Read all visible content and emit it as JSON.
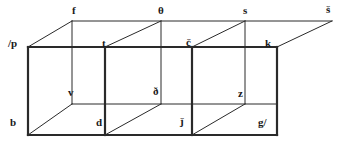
{
  "figure": {
    "background_color": "#ffffff",
    "stroke_color": "#2a2a2a",
    "thick_stroke_width": 2.2,
    "thin_stroke_width": 1.0,
    "width": 343,
    "height": 145
  },
  "vertices": [
    {
      "id": "p",
      "label": "/p",
      "x": 8,
      "y": 38,
      "role": "back-top-left"
    },
    {
      "id": "f",
      "label": "f",
      "x": 72,
      "y": 5,
      "role": "back-top-1"
    },
    {
      "id": "theta",
      "label": "θ",
      "x": 158,
      "y": 5,
      "role": "back-top-2"
    },
    {
      "id": "s",
      "label": "s",
      "x": 243,
      "y": 5,
      "role": "back-top-3"
    },
    {
      "id": "shacek",
      "label": "š",
      "x": 326,
      "y": 4,
      "role": "back-top-4"
    },
    {
      "id": "t",
      "label": "t",
      "x": 102,
      "y": 38,
      "role": "front-top-1"
    },
    {
      "id": "ccaron",
      "label": "č",
      "x": 186,
      "y": 37,
      "role": "front-top-2"
    },
    {
      "id": "k",
      "label": "k",
      "x": 265,
      "y": 38,
      "role": "front-top-3"
    },
    {
      "id": "v",
      "label": "v",
      "x": 68,
      "y": 87,
      "role": "back-bottom-1"
    },
    {
      "id": "eth",
      "label": "ð",
      "x": 153,
      "y": 86,
      "role": "back-bottom-2"
    },
    {
      "id": "z",
      "label": "z",
      "x": 238,
      "y": 88,
      "role": "back-bottom-3"
    },
    {
      "id": "b",
      "label": "b",
      "x": 10,
      "y": 117,
      "role": "front-bottom-left"
    },
    {
      "id": "d",
      "label": "d",
      "x": 96,
      "y": 117,
      "role": "front-bottom-1"
    },
    {
      "id": "jcaron",
      "label": "ǰ",
      "x": 180,
      "y": 116,
      "role": "front-bottom-2"
    },
    {
      "id": "g",
      "label": "g/",
      "x": 258,
      "y": 117,
      "role": "front-bottom-3"
    }
  ],
  "edges": {
    "thick": [
      {
        "name": "front-face-top-rail",
        "x1": 28,
        "y1": 47,
        "x2": 277,
        "y2": 47
      },
      {
        "name": "front-face-bottom-rail",
        "x1": 28,
        "y1": 135,
        "x2": 277,
        "y2": 135
      },
      {
        "name": "front-left-vertical",
        "x1": 28,
        "y1": 47,
        "x2": 28,
        "y2": 135
      },
      {
        "name": "front-divider-1",
        "x1": 105,
        "y1": 47,
        "x2": 105,
        "y2": 135
      },
      {
        "name": "front-divider-2",
        "x1": 192,
        "y1": 47,
        "x2": 192,
        "y2": 135
      },
      {
        "name": "front-right-vertical",
        "x1": 277,
        "y1": 47,
        "x2": 277,
        "y2": 135
      }
    ],
    "thin": [
      {
        "name": "back-top-rail",
        "x1": 72,
        "y1": 21,
        "x2": 332,
        "y2": 21
      },
      {
        "name": "back-mid-rail",
        "x1": 72,
        "y1": 104,
        "x2": 277,
        "y2": 104
      },
      {
        "name": "back-vertical-f",
        "x1": 72,
        "y1": 21,
        "x2": 72,
        "y2": 104
      },
      {
        "name": "back-vertical-theta",
        "x1": 161,
        "y1": 21,
        "x2": 161,
        "y2": 104
      },
      {
        "name": "back-vertical-s",
        "x1": 245,
        "y1": 21,
        "x2": 245,
        "y2": 104
      },
      {
        "name": "depth-p-to-f",
        "x1": 28,
        "y1": 47,
        "x2": 72,
        "y2": 21
      },
      {
        "name": "depth-t-to-theta",
        "x1": 105,
        "y1": 47,
        "x2": 161,
        "y2": 21
      },
      {
        "name": "depth-c-to-s",
        "x1": 192,
        "y1": 47,
        "x2": 245,
        "y2": 21
      },
      {
        "name": "depth-k-to-s-caron",
        "x1": 277,
        "y1": 47,
        "x2": 332,
        "y2": 21
      },
      {
        "name": "depth-b-to-v",
        "x1": 28,
        "y1": 135,
        "x2": 72,
        "y2": 104
      },
      {
        "name": "depth-d-to-eth",
        "x1": 105,
        "y1": 135,
        "x2": 161,
        "y2": 104
      },
      {
        "name": "depth-j-to-z",
        "x1": 192,
        "y1": 135,
        "x2": 245,
        "y2": 104
      }
    ]
  }
}
